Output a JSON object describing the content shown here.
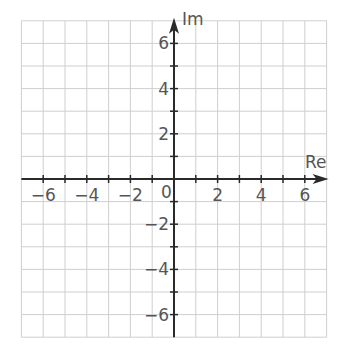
{
  "diagram": {
    "type": "complex-plane",
    "x_axis_label": "Re",
    "y_axis_label": "Im",
    "origin_label": "0",
    "x_range": [
      -7,
      7
    ],
    "y_range": [
      -7,
      7
    ],
    "grid_step": 1,
    "x_tick_labels": [
      {
        "value": -6,
        "text": "−6"
      },
      {
        "value": -4,
        "text": "−4"
      },
      {
        "value": -2,
        "text": "−2"
      },
      {
        "value": 2,
        "text": "2"
      },
      {
        "value": 4,
        "text": "4"
      },
      {
        "value": 6,
        "text": "6"
      }
    ],
    "y_tick_labels": [
      {
        "value": 6,
        "text": "6"
      },
      {
        "value": 4,
        "text": "4"
      },
      {
        "value": 2,
        "text": "2"
      },
      {
        "value": -2,
        "text": "−2"
      },
      {
        "value": -4,
        "text": "−4"
      },
      {
        "value": -6,
        "text": "−6"
      }
    ],
    "colors": {
      "grid": "#cfcfcf",
      "axis": "#2a2a2a",
      "label": "#555555",
      "background": "#ffffff"
    }
  }
}
